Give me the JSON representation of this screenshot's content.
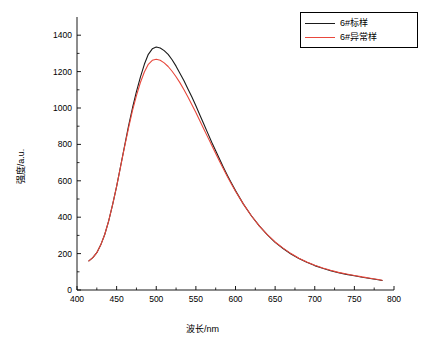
{
  "chart_data": {
    "type": "line",
    "title": "",
    "xlabel": "波长/nm",
    "ylabel": "强度/a.u.",
    "xlim": [
      400,
      800
    ],
    "ylim": [
      0,
      1500
    ],
    "xticks": [
      400,
      450,
      500,
      550,
      600,
      650,
      700,
      750,
      800
    ],
    "yticks": [
      0,
      200,
      400,
      600,
      800,
      1000,
      1200,
      1400
    ],
    "grid": false,
    "legend_position": "top-right",
    "series": [
      {
        "name": "6#标样",
        "color": "#1a1a1a",
        "x": [
          415,
          420,
          425,
          430,
          435,
          440,
          445,
          450,
          455,
          460,
          465,
          470,
          475,
          480,
          485,
          490,
          495,
          500,
          505,
          510,
          515,
          520,
          525,
          530,
          535,
          540,
          545,
          550,
          555,
          560,
          565,
          570,
          575,
          580,
          585,
          590,
          595,
          600,
          610,
          620,
          630,
          640,
          650,
          660,
          670,
          680,
          690,
          700,
          710,
          720,
          730,
          740,
          750,
          760,
          770,
          780,
          785
        ],
        "values": [
          160,
          178,
          205,
          248,
          305,
          380,
          470,
          570,
          680,
          790,
          900,
          1000,
          1090,
          1170,
          1240,
          1295,
          1325,
          1335,
          1330,
          1315,
          1295,
          1265,
          1230,
          1190,
          1150,
          1105,
          1060,
          1012,
          962,
          912,
          862,
          812,
          765,
          718,
          672,
          628,
          586,
          546,
          472,
          408,
          352,
          304,
          262,
          228,
          198,
          173,
          152,
          134,
          119,
          106,
          95,
          86,
          78,
          70,
          63,
          56,
          52
        ]
      },
      {
        "name": "6#异常样",
        "color": "#e8483c",
        "x": [
          415,
          420,
          425,
          430,
          435,
          440,
          445,
          450,
          455,
          460,
          465,
          470,
          475,
          480,
          485,
          490,
          495,
          500,
          505,
          510,
          515,
          520,
          525,
          530,
          535,
          540,
          545,
          550,
          555,
          560,
          565,
          570,
          575,
          580,
          585,
          590,
          595,
          600,
          610,
          620,
          630,
          640,
          650,
          660,
          670,
          680,
          690,
          700,
          710,
          720,
          730,
          740,
          750,
          760,
          770,
          780,
          785
        ],
        "values": [
          160,
          178,
          205,
          248,
          305,
          380,
          470,
          570,
          678,
          786,
          890,
          985,
          1068,
          1140,
          1198,
          1240,
          1262,
          1268,
          1262,
          1248,
          1228,
          1202,
          1172,
          1138,
          1100,
          1060,
          1018,
          975,
          930,
          885,
          840,
          795,
          750,
          706,
          663,
          621,
          581,
          543,
          472,
          408,
          352,
          304,
          264,
          230,
          200,
          175,
          154,
          136,
          121,
          108,
          97,
          88,
          80,
          72,
          65,
          58,
          54
        ]
      }
    ]
  },
  "legend": {
    "items": [
      {
        "label": "6#标样",
        "color": "#1a1a1a"
      },
      {
        "label": "6#异常样",
        "color": "#e8483c"
      }
    ]
  }
}
